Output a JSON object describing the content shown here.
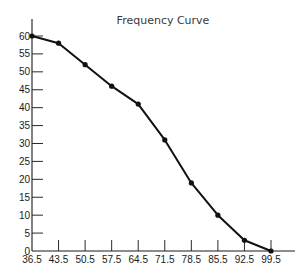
{
  "chart_data": {
    "type": "line",
    "title": "Frequency Curve",
    "xlabel": "",
    "ylabel": "",
    "x": [
      36.5,
      43.5,
      50.5,
      57.5,
      64.5,
      71.5,
      78.5,
      85.5,
      92.5,
      99.5
    ],
    "x_tick_labels": [
      "36.5",
      "43.5",
      "50.5",
      "57.5",
      "64.5",
      "71.5",
      "78.5",
      "85.5",
      "92.5",
      "99.5"
    ],
    "y_ticks": [
      0,
      5,
      10,
      15,
      20,
      25,
      30,
      35,
      40,
      45,
      50,
      55,
      60
    ],
    "y_tick_labels": [
      "0",
      "5",
      "10",
      "15",
      "20",
      "25",
      "30",
      "35",
      "40",
      "45",
      "50",
      "55",
      "60"
    ],
    "series": [
      {
        "name": "Frequency",
        "values": [
          60,
          58,
          52,
          46,
          41,
          31,
          19,
          10,
          3,
          0
        ],
        "color": "#111111",
        "markers": true
      }
    ],
    "xlim": [
      36.5,
      99.5
    ],
    "ylim": [
      0,
      60
    ],
    "grid": false,
    "legend": "none"
  }
}
